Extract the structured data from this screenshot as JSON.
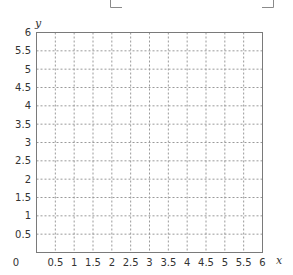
{
  "chart_data": {
    "type": "scatter",
    "title": "",
    "xlabel": "x",
    "ylabel": "y",
    "xlim": [
      0,
      6
    ],
    "ylim": [
      0,
      6
    ],
    "x_ticks": [
      0.5,
      1,
      1.5,
      2,
      2.5,
      3,
      3.5,
      4,
      4.5,
      5,
      5.5,
      6
    ],
    "y_ticks": [
      0.5,
      1,
      1.5,
      2,
      2.5,
      3,
      3.5,
      4,
      4.5,
      5,
      5.5,
      6
    ],
    "x_tick_labels": [
      "0",
      "0.5",
      "1",
      "1.5",
      "2",
      "2.5",
      "3",
      "3.5",
      "4",
      "4.5",
      "5",
      "5.5",
      "6"
    ],
    "y_tick_labels": [
      "0.5",
      "1",
      "1.5",
      "2",
      "2.5",
      "3",
      "3.5",
      "4",
      "4.5",
      "5",
      "5.5",
      "6"
    ],
    "grid": true,
    "grid_style": "dashed",
    "series": [],
    "legend": null
  },
  "colors": {
    "axis": "#7a7a7a",
    "grid": "#9a9a9a",
    "text": "#333333",
    "bracket": "#8a8a8a"
  }
}
